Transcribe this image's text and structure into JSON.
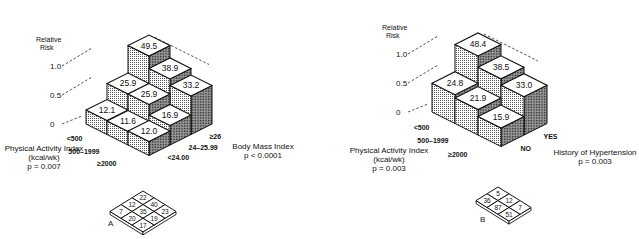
{
  "chart_data": [
    {
      "type": "bar3d",
      "panel": "A",
      "ylabel": "Relative Risk",
      "yticks": [
        "0",
        "0.5",
        "1.0"
      ],
      "ylim": [
        0,
        1.0
      ],
      "x_axis": {
        "label": "Physical Activity Index",
        "unit": "(kcal/wk)",
        "pvalue": "p = 0.007",
        "categories": [
          "<500",
          "500–1999",
          "≥2000"
        ]
      },
      "z_axis": {
        "label": "Body Mass Index",
        "pvalue": "p < 0.0001",
        "categories": [
          "<24.00",
          "24–25.99",
          "≥26"
        ]
      },
      "values": [
        [
          12.1,
          25.9,
          49.5
        ],
        [
          11.6,
          25.9,
          38.9
        ],
        [
          12.0,
          16.9,
          33.2
        ]
      ],
      "value_labels": [
        [
          "12.1",
          "25.9",
          "49.5"
        ],
        [
          "11.6",
          "25.9",
          "38.9"
        ],
        [
          "12.0",
          "16.9",
          "33.2"
        ]
      ],
      "sample_grid": {
        "label": "A",
        "cells": [
          "22",
          "12",
          "40",
          "7",
          "35",
          "23",
          "20",
          "19",
          "17"
        ]
      }
    },
    {
      "type": "bar3d",
      "panel": "B",
      "ylabel": "Relative Risk",
      "yticks": [
        "0",
        "0.5",
        "1.0"
      ],
      "ylim": [
        0,
        1.0
      ],
      "x_axis": {
        "label": "Physical Activity Index",
        "unit": "(kcal/wk)",
        "pvalue": "p = 0.003",
        "categories": [
          "<500",
          "500–1999",
          "≥2000"
        ]
      },
      "z_axis": {
        "label": "History of Hypertension",
        "pvalue": "p = 0.003",
        "categories": [
          "NO",
          "YES"
        ]
      },
      "values": [
        [
          24.8,
          48.4
        ],
        [
          21.9,
          38.5
        ],
        [
          15.9,
          33.0
        ]
      ],
      "value_labels": [
        [
          "24.8",
          "48.4"
        ],
        [
          "21.9",
          "38.5"
        ],
        [
          "15.9",
          "33.0"
        ]
      ],
      "sample_grid": {
        "label": "B",
        "cells": [
          "5",
          "36",
          "12",
          "87",
          "7",
          "51"
        ]
      }
    }
  ]
}
